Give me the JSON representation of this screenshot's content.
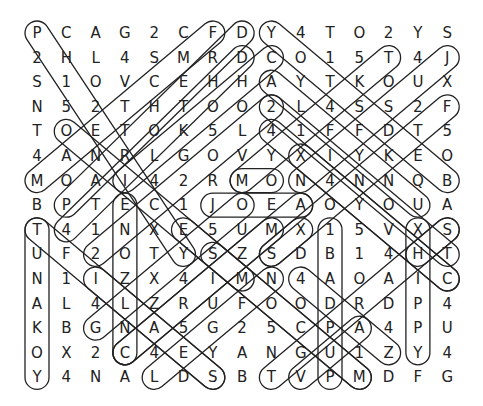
{
  "puzzle": {
    "rows": [
      "PCAG2CFDY4TO2YS",
      "2HL4SMRDCO15T4J",
      "S1OVCEHHAYTKOUX",
      "N52THTOO2L4SS2F",
      "TOETOK5L41FFDT5",
      "4ANRLGOVYXIYKEO",
      "MOAI42RMON4NNQB",
      "BPTEC1JOEAOYOUA",
      "T41NXE5UMX15VXS",
      "UF2OTYSZSDB14HT",
      "N1IZX4IMN4AOAIC",
      "AL4LZRUFOODRDP4",
      "KBGNA5G25CPA4PU",
      "OX2C4EYANGU1ZY4",
      "Y4NALDSBTVPMDFG"
    ],
    "capsules": [
      [
        0,
        0,
        5,
        9
      ],
      [
        6,
        0,
        0,
        6
      ],
      [
        7,
        0,
        1,
        7
      ],
      [
        7,
        1,
        1,
        8
      ],
      [
        8,
        1,
        3,
        6
      ],
      [
        8,
        0,
        14,
        6
      ],
      [
        12,
        1,
        7,
        6
      ],
      [
        14,
        1,
        9,
        6
      ],
      [
        8,
        2,
        13,
        7
      ],
      [
        8,
        3,
        14,
        9
      ],
      [
        14,
        3,
        8,
        9
      ],
      [
        8,
        4,
        14,
        10
      ],
      [
        1,
        4,
        7,
        10
      ],
      [
        0,
        8,
        0,
        14
      ],
      [
        3,
        7,
        3,
        13
      ],
      [
        0,
        8,
        6,
        14
      ],
      [
        2,
        9,
        8,
        3
      ],
      [
        4,
        14,
        8,
        10
      ],
      [
        3,
        13,
        9,
        7
      ],
      [
        6,
        14,
        2,
        10
      ],
      [
        7,
        6,
        8,
        6
      ],
      [
        6,
        7,
        9,
        7
      ],
      [
        9,
        8,
        8,
        9
      ],
      [
        10,
        8,
        10,
        14
      ],
      [
        13,
        8,
        13,
        13
      ],
      [
        14,
        8,
        13,
        9
      ],
      [
        14,
        10,
        9,
        5
      ],
      [
        6,
        9,
        11,
        14
      ],
      [
        9,
        14,
        11,
        12
      ],
      [
        12,
        13,
        9,
        10
      ],
      [
        8,
        14,
        14,
        8
      ],
      [
        11,
        14,
        5,
        8
      ],
      [
        2,
        12,
        7,
        7
      ],
      [
        3,
        13,
        8,
        8
      ]
    ],
    "stroke_color": "#222222"
  }
}
